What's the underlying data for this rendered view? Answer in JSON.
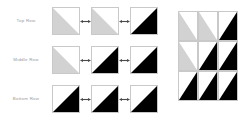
{
  "diagram": {
    "background_color": "#ffffff",
    "tile_border_color": "#c9c9c9",
    "label_color": "#9a9a9a",
    "fill_colors": {
      "light": "#d2d2d2",
      "dark": "#000000",
      "empty": "#ffffff"
    },
    "connector": {
      "icon": "double-headed-arrow-icon",
      "label": "↔",
      "color": "#4a4a4a"
    },
    "rows": [
      {
        "label": "Top Row",
        "tiles": [
          {
            "fill": "light",
            "orientation": "lower-left"
          },
          {
            "fill": "light",
            "orientation": "lower-left"
          },
          {
            "fill": "dark",
            "orientation": "lower-right"
          }
        ]
      },
      {
        "label": "Middle Row",
        "tiles": [
          {
            "fill": "light",
            "orientation": "lower-left"
          },
          {
            "fill": "dark",
            "orientation": "lower-right"
          },
          {
            "fill": "dark",
            "orientation": "lower-right"
          }
        ]
      },
      {
        "label": "Bottom Row",
        "tiles": [
          {
            "fill": "dark",
            "orientation": "lower-right"
          },
          {
            "fill": "dark",
            "orientation": "lower-right"
          },
          {
            "fill": "dark",
            "orientation": "lower-right"
          }
        ]
      }
    ],
    "assembled_block": {
      "columns": 3,
      "rows": 3,
      "cells": [
        {
          "fill": "light",
          "orientation": "lower-left"
        },
        {
          "fill": "light",
          "orientation": "lower-left"
        },
        {
          "fill": "dark",
          "orientation": "lower-right"
        },
        {
          "fill": "light",
          "orientation": "lower-left"
        },
        {
          "fill": "dark",
          "orientation": "lower-right"
        },
        {
          "fill": "dark",
          "orientation": "lower-right"
        },
        {
          "fill": "dark",
          "orientation": "lower-right"
        },
        {
          "fill": "dark",
          "orientation": "lower-right"
        },
        {
          "fill": "dark",
          "orientation": "lower-right"
        }
      ]
    }
  }
}
